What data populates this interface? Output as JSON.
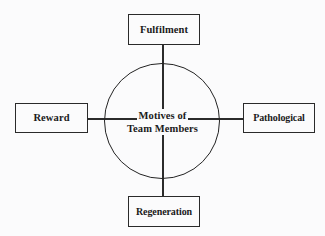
{
  "diagram": {
    "type": "radial-spoke-diagram",
    "center": {
      "line1": "Motives of",
      "line2": "Team Members",
      "shape": "circle"
    },
    "nodes": [
      {
        "id": "fulfilment",
        "label": "Fulfilment",
        "position": "top"
      },
      {
        "id": "pathological",
        "label": "Pathological",
        "position": "right"
      },
      {
        "id": "regeneration",
        "label": "Regeneration",
        "position": "bottom"
      },
      {
        "id": "reward",
        "label": "Reward",
        "position": "left"
      }
    ],
    "connectors": [
      {
        "id": "top",
        "from": "fulfilment",
        "to": "center"
      },
      {
        "id": "right",
        "from": "center",
        "to": "pathological"
      },
      {
        "id": "bottom",
        "from": "center",
        "to": "regeneration"
      },
      {
        "id": "left",
        "from": "reward",
        "to": "center"
      }
    ],
    "colors": {
      "background": "#fbfbfc",
      "stroke": "#2a2a2a",
      "text": "#1a1a1a"
    }
  }
}
